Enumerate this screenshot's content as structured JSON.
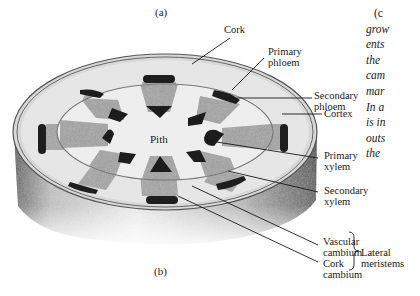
{
  "figure": {
    "caption_a": "(a)",
    "caption_b": "(b)",
    "center_label": "Pith"
  },
  "labels": {
    "cork": "Cork",
    "primary_phloem": [
      "Primary",
      "phloem"
    ],
    "secondary_phloem": [
      "Secondary",
      "phloem"
    ],
    "cortex": "Cortex",
    "primary_xylem": [
      "Primary",
      "xylem"
    ],
    "secondary_xylem": [
      "Secondary",
      "xylem"
    ],
    "vascular_cambium": [
      "Vascular",
      "cambium"
    ],
    "cork_cambium": [
      "Cork",
      "cambium"
    ],
    "lateral_meristems": [
      "Lateral",
      "meristems"
    ]
  },
  "side_text": {
    "lines": [
      "(c",
      "grow",
      "ents",
      "the",
      "cam",
      "mar",
      "In a",
      "is in",
      "outs",
      "the"
    ]
  },
  "colors": {
    "ink": "#1a1a1a",
    "cortex_fill": "#e4e4e4",
    "pith_fill": "#ececec",
    "bundle_fill": "#a8a8a8",
    "dark_cap": "#1c1c1c",
    "rim": "#6a6a6a"
  }
}
